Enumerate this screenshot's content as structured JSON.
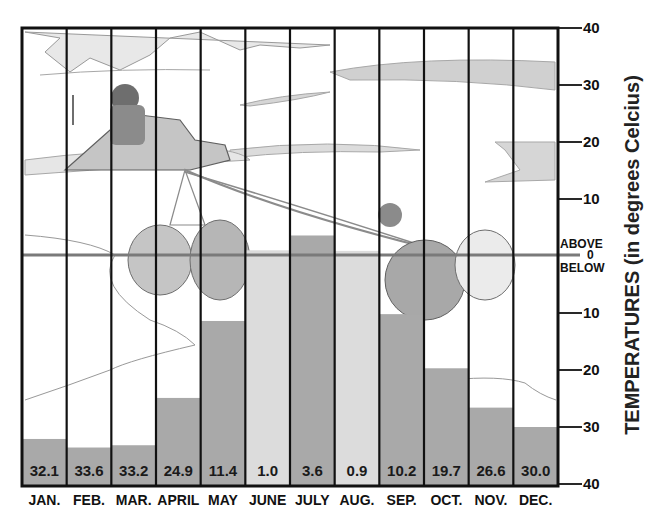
{
  "chart_data": {
    "type": "bar",
    "title": "",
    "xlabel": "",
    "ylabel": "TEMPERATURES (in degrees Celcius)",
    "ylim": [
      -40,
      40
    ],
    "y_ticks": [
      40,
      30,
      20,
      10,
      0,
      -10,
      -20,
      -30,
      -40
    ],
    "y_tick_labels": [
      "40",
      "30",
      "20",
      "10",
      "0",
      "10",
      "20",
      "30",
      "40"
    ],
    "zero_line_labels": {
      "above": "ABOVE",
      "zero": "0",
      "below": "BELOW"
    },
    "grid": false,
    "legend": null,
    "categories": [
      "JAN.",
      "FEB.",
      "MAR.",
      "APRIL",
      "MAY",
      "JUNE",
      "JULY",
      "AUG.",
      "SEP.",
      "OCT.",
      "NOV.",
      "DEC."
    ],
    "series": [
      {
        "name": "Monthly average temperature",
        "values": [
          -32.1,
          -33.6,
          -33.2,
          -24.9,
          -11.4,
          1.0,
          3.6,
          0.9,
          -10.2,
          -19.7,
          -26.6,
          -30.0
        ],
        "value_labels": [
          "32.1",
          "33.6",
          "33.2",
          "24.9",
          "11.4",
          "1.0",
          "3.6",
          "0.9",
          "10.2",
          "19.7",
          "26.6",
          "30.0"
        ],
        "bar_colors": [
          "#a9a9a9",
          "#a9a9a9",
          "#a9a9a9",
          "#a9a9a9",
          "#a9a9a9",
          "#dcdcdc",
          "#a9a9a9",
          "#dcdcdc",
          "#a9a9a9",
          "#a9a9a9",
          "#a9a9a9",
          "#a9a9a9"
        ]
      }
    ],
    "background_illustration": "pencil sketch of an Arctic scene: a person on a dog sled pulled by a team of sled dogs across ice and snow",
    "colors": {
      "frame": "#111111",
      "zero_line": "#7a7a7a",
      "bar_dark": "#a9a9a9",
      "bar_light": "#dcdcdc"
    }
  },
  "caption_partial": ""
}
